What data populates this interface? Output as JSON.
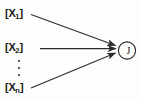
{
  "figure": {
    "type": "node-edge-diagram",
    "background_color": "#fdfdfc",
    "stroke_color": "#2b2b2b",
    "text_color": "#1a1a1a"
  },
  "inputs": [
    {
      "bracket_open": "[",
      "symbol": "X",
      "subscript": "1",
      "bracket_close": "]"
    },
    {
      "bracket_open": "[",
      "symbol": "X",
      "subscript": "2",
      "bracket_close": "]"
    },
    {
      "bracket_open": "[",
      "symbol": "X",
      "subscript": "n",
      "bracket_close": "]"
    }
  ],
  "ellipsis": {
    "dots": 3,
    "orientation": "vertical"
  },
  "output_node": {
    "label": "J",
    "shape": "circle"
  },
  "edges": [
    {
      "from": "[X1]",
      "to": "J",
      "arrow": true
    },
    {
      "from": "[X2]",
      "to": "J",
      "arrow": true
    },
    {
      "from": "[Xn]",
      "to": "J",
      "arrow": true
    }
  ]
}
